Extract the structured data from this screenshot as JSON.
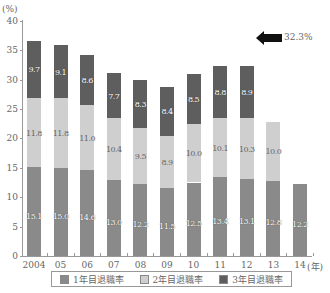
{
  "chart_data": {
    "type": "bar",
    "stacked": true,
    "title": "",
    "xlabel": "(年)",
    "ylabel": "(%)",
    "ylim": [
      0,
      40
    ],
    "yticks": [
      0,
      5,
      10,
      15,
      20,
      25,
      30,
      35,
      40
    ],
    "categories": [
      "2004",
      "05",
      "06",
      "07",
      "08",
      "09",
      "10",
      "11",
      "12",
      "13",
      "14"
    ],
    "series": [
      {
        "name": "1年目退職率",
        "color": "#8a8a8a",
        "values": [
          15.1,
          15.0,
          14.6,
          13.0,
          12.2,
          11.5,
          12.5,
          13.4,
          13.1,
          12.8,
          12.2
        ]
      },
      {
        "name": "2年目退職率",
        "color": "#cfcfcf",
        "values": [
          11.8,
          11.8,
          11.0,
          10.4,
          9.5,
          8.9,
          10.0,
          10.1,
          10.3,
          10.0,
          null
        ]
      },
      {
        "name": "3年目退職率",
        "color": "#5e5e5e",
        "values": [
          9.7,
          9.1,
          8.6,
          7.7,
          8.3,
          8.4,
          8.5,
          8.8,
          8.9,
          null,
          null
        ]
      }
    ],
    "annotations": [
      {
        "target": "12",
        "text": "32.3%",
        "type": "arrow"
      }
    ],
    "legend_position": "bottom",
    "grid": false
  },
  "axis": {
    "y_unit": "(%)",
    "x_unit": "(年)",
    "yticks": [
      "0",
      "5",
      "10",
      "15",
      "20",
      "25",
      "30",
      "35",
      "40"
    ]
  },
  "annotation": {
    "text": "32.3%"
  },
  "legend": {
    "items": [
      {
        "label": "1年目退職率",
        "color": "#8a8a8a"
      },
      {
        "label": "2年目退職率",
        "color": "#cfcfcf"
      },
      {
        "label": "3年目退職率",
        "color": "#5e5e5e"
      }
    ]
  }
}
